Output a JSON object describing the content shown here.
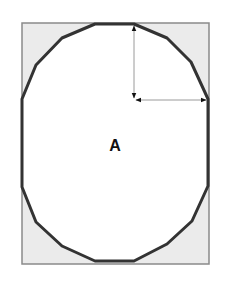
{
  "diagram": {
    "label": "A",
    "label_pos": [
      115,
      146
    ],
    "colors": {
      "background": "#ffffff",
      "rect_fill": "#ebebeb",
      "rect_stroke": "#8a8a8a",
      "shape_fill": "#ffffff",
      "shape_stroke": "#333333",
      "arrow": "#9a9a9a",
      "arrowhead": "#111111"
    },
    "rect": {
      "x": 22,
      "y": 23,
      "width": 187,
      "height": 241
    },
    "shape_points": "95,24 134,24 167,38 191,62 208,99 208,186 192,221 167,244 134,261 95,261 62,246 36,222 22,187 22,99 36,65 62,38",
    "arrows": [
      {
        "name": "vertical-radius-arrow",
        "x1": 134,
        "y1": 26,
        "x2": 134,
        "y2": 98
      },
      {
        "name": "horizontal-radius-arrow",
        "x1": 136,
        "y1": 100,
        "x2": 206,
        "y2": 100
      }
    ]
  }
}
